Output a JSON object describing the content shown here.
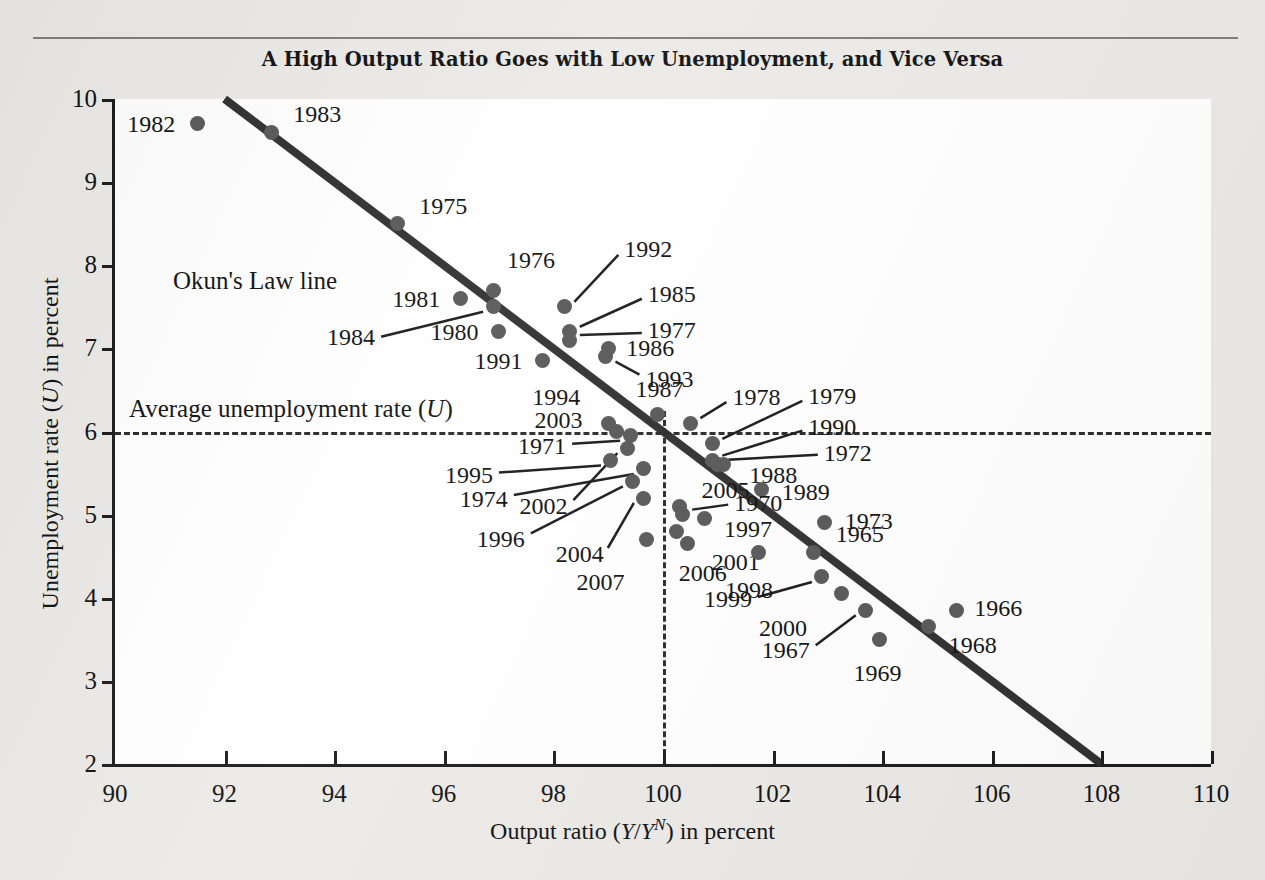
{
  "figure": {
    "title": "A High Output Ratio Goes with Low Unemployment, and Vice Versa",
    "background_color": "#eceae7",
    "plot_background_color": "#ffffff",
    "point_color": "#585858",
    "line_color": "#303030"
  },
  "annotations": {
    "okun_line_label": "Okun's Law line",
    "average_label_prefix": "Average unemployment rate (",
    "average_label_symbol": "U",
    "average_label_suffix": ")"
  },
  "axis_titles": {
    "x_prefix": "Output ratio (",
    "x_y": "Y",
    "x_slash": "/",
    "x_y2": "Y",
    "x_sup": "N",
    "x_suffix": ") in percent",
    "y_prefix": "Unemployment rate (",
    "y_symbol": "U",
    "y_suffix": ") in percent"
  },
  "chart_data": {
    "type": "scatter",
    "title": "A High Output Ratio Goes with Low Unemployment, and Vice Versa",
    "xlabel": "Output ratio (Y/Y^N) in percent",
    "ylabel": "Unemployment rate (U) in percent",
    "xlim": [
      90,
      110
    ],
    "ylim": [
      2,
      10
    ],
    "xticks": [
      90,
      92,
      94,
      96,
      98,
      100,
      102,
      104,
      106,
      108,
      110
    ],
    "yticks": [
      2,
      3,
      4,
      5,
      6,
      7,
      8,
      9,
      10
    ],
    "grid": false,
    "legend": null,
    "reference_lines": [
      {
        "name": "average-unemployment-rate",
        "orientation": "horizontal",
        "value": 6.0,
        "style": "dashed"
      },
      {
        "name": "natural-output-ratio",
        "orientation": "vertical",
        "value": 100.0,
        "style": "dashed"
      }
    ],
    "fit_line": {
      "name": "Okun's Law line",
      "x0": 92.0,
      "y0": 10.0,
      "x1": 108.0,
      "y1": 2.0,
      "slope": -0.5
    },
    "points": [
      {
        "label": "1982",
        "x": 91.5,
        "y": 9.7,
        "label_side": "left"
      },
      {
        "label": "1983",
        "x": 92.85,
        "y": 9.6,
        "label_side": "right"
      },
      {
        "label": "1975",
        "x": 95.15,
        "y": 8.5,
        "label_side": "right"
      },
      {
        "label": "1976",
        "x": 96.9,
        "y": 7.7,
        "label_side": "above-right"
      },
      {
        "label": "1981",
        "x": 96.3,
        "y": 7.6,
        "label_side": "left"
      },
      {
        "label": "1984",
        "x": 96.9,
        "y": 7.5,
        "label_side": "leader-left"
      },
      {
        "label": "1980",
        "x": 97.0,
        "y": 7.2,
        "label_side": "left"
      },
      {
        "label": "1992",
        "x": 98.2,
        "y": 7.5,
        "label_side": "leader-upper-right"
      },
      {
        "label": "1985",
        "x": 98.3,
        "y": 7.2,
        "label_side": "leader-right"
      },
      {
        "label": "1977",
        "x": 98.3,
        "y": 7.1,
        "label_side": "leader-right"
      },
      {
        "label": "1986",
        "x": 99.0,
        "y": 7.0,
        "label_side": "right"
      },
      {
        "label": "1991",
        "x": 97.8,
        "y": 6.85,
        "label_side": "left"
      },
      {
        "label": "1993",
        "x": 98.95,
        "y": 6.9,
        "label_side": "leader-right"
      },
      {
        "label": "1987",
        "x": 99.9,
        "y": 6.2,
        "label_side": "above"
      },
      {
        "label": "1994",
        "x": 99.0,
        "y": 6.1,
        "label_side": "above-left"
      },
      {
        "label": "1978",
        "x": 100.5,
        "y": 6.1,
        "label_side": "right"
      },
      {
        "label": "2003",
        "x": 99.15,
        "y": 6.0,
        "label_side": "left"
      },
      {
        "label": "1979",
        "x": 100.9,
        "y": 5.85,
        "label_side": "leader-upper-right"
      },
      {
        "label": "1971",
        "x": 99.4,
        "y": 5.95,
        "label_side": "leader-left"
      },
      {
        "label": "2002",
        "x": 99.35,
        "y": 5.8,
        "label_side": "leader-lower-left"
      },
      {
        "label": "1995",
        "x": 99.05,
        "y": 5.65,
        "label_side": "leader-left"
      },
      {
        "label": "1990",
        "x": 100.9,
        "y": 5.65,
        "label_side": "leader-upper-right"
      },
      {
        "label": "1972",
        "x": 101.0,
        "y": 5.6,
        "label_side": "leader-right"
      },
      {
        "label": "1988",
        "x": 101.1,
        "y": 5.6,
        "label_side": "right"
      },
      {
        "label": "1974",
        "x": 99.65,
        "y": 5.55,
        "label_side": "leader-left"
      },
      {
        "label": "1996",
        "x": 99.45,
        "y": 5.4,
        "label_side": "leader-lower-left"
      },
      {
        "label": "1989",
        "x": 101.8,
        "y": 5.3,
        "label_side": "right"
      },
      {
        "label": "2004",
        "x": 99.65,
        "y": 5.2,
        "label_side": "leader-lower-left"
      },
      {
        "label": "2005",
        "x": 100.3,
        "y": 5.1,
        "label_side": "right"
      },
      {
        "label": "1970",
        "x": 100.35,
        "y": 5.0,
        "label_side": "leader-right"
      },
      {
        "label": "1997",
        "x": 100.75,
        "y": 4.95,
        "label_side": "right"
      },
      {
        "label": "1973",
        "x": 102.95,
        "y": 4.9,
        "label_side": "right"
      },
      {
        "label": "2007",
        "x": 99.7,
        "y": 4.7,
        "label_side": "below-left"
      },
      {
        "label": "2006",
        "x": 100.25,
        "y": 4.8,
        "label_side": "below"
      },
      {
        "label": "2001",
        "x": 100.45,
        "y": 4.65,
        "label_side": "right"
      },
      {
        "label": "1965",
        "x": 102.75,
        "y": 4.55,
        "label_side": "right"
      },
      {
        "label": "1998",
        "x": 101.75,
        "y": 4.55,
        "label_side": "below"
      },
      {
        "label": "1999",
        "x": 102.9,
        "y": 4.25,
        "label_side": "leader-lower-left"
      },
      {
        "label": "2000",
        "x": 103.25,
        "y": 4.05,
        "label_side": "below-left"
      },
      {
        "label": "1967",
        "x": 103.7,
        "y": 3.85,
        "label_side": "leader-lower-left"
      },
      {
        "label": "1966",
        "x": 105.35,
        "y": 3.85,
        "label_side": "right"
      },
      {
        "label": "1968",
        "x": 104.85,
        "y": 3.65,
        "label_side": "right"
      },
      {
        "label": "1969",
        "x": 103.95,
        "y": 3.5,
        "label_side": "below"
      }
    ]
  }
}
